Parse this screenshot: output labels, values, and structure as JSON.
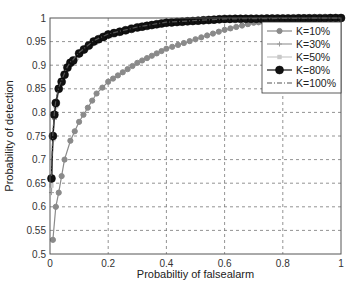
{
  "chart_data": {
    "type": "line",
    "title": "",
    "xlabel": "Probabiltiy of falsealarm",
    "ylabel": "Probability of detection",
    "xlim": [
      0,
      1
    ],
    "ylim": [
      0.5,
      1
    ],
    "xticks": [
      "0",
      "0.2",
      "0.4",
      "0.6",
      "0.8",
      "1"
    ],
    "yticks": [
      "0.5",
      "0.55",
      "0.6",
      "0.65",
      "0.7",
      "0.75",
      "0.8",
      "0.85",
      "0.9",
      "0.95",
      "1"
    ],
    "grid": true,
    "legend_position": "upper right",
    "series": [
      {
        "name": "K=10%",
        "color": "#8a8a8a",
        "marker": "circle-small",
        "line": "solid",
        "x": [
          0.01,
          0.02,
          0.03,
          0.04,
          0.05,
          0.07,
          0.1,
          0.13,
          0.16,
          0.2,
          0.25,
          0.3,
          0.35,
          0.4,
          0.5,
          0.6,
          0.7,
          0.8,
          1.0
        ],
        "y": [
          0.53,
          0.6,
          0.63,
          0.665,
          0.7,
          0.74,
          0.78,
          0.81,
          0.84,
          0.865,
          0.885,
          0.905,
          0.92,
          0.935,
          0.955,
          0.975,
          0.99,
          0.995,
          1.0
        ]
      },
      {
        "name": "K=30%",
        "color": "#9a9a9a",
        "marker": "plus",
        "line": "solid",
        "x": [
          0.005,
          0.01,
          0.015,
          0.02,
          0.03,
          0.04,
          0.05,
          0.06,
          0.07,
          0.08,
          0.1,
          0.15,
          0.2,
          0.3,
          0.4,
          0.6,
          1.0
        ],
        "y": [
          0.63,
          0.74,
          0.785,
          0.81,
          0.845,
          0.86,
          0.875,
          0.89,
          0.9,
          0.905,
          0.92,
          0.945,
          0.96,
          0.978,
          0.988,
          0.997,
          1.0
        ]
      },
      {
        "name": "K=50%",
        "color": "#c8c8c8",
        "marker": "square",
        "line": "solid",
        "x": [
          0.005,
          0.01,
          0.015,
          0.02,
          0.03,
          0.04,
          0.05,
          0.06,
          0.07,
          0.08,
          0.1,
          0.15,
          0.2,
          0.3,
          0.4,
          0.6,
          1.0
        ],
        "y": [
          0.645,
          0.745,
          0.79,
          0.815,
          0.848,
          0.862,
          0.878,
          0.892,
          0.902,
          0.908,
          0.922,
          0.948,
          0.962,
          0.979,
          0.989,
          0.998,
          1.0
        ]
      },
      {
        "name": "K=80%",
        "color": "#111111",
        "marker": "circle-large",
        "line": "solid",
        "x": [
          0.005,
          0.01,
          0.015,
          0.02,
          0.03,
          0.04,
          0.05,
          0.06,
          0.07,
          0.08,
          0.1,
          0.15,
          0.2,
          0.3,
          0.4,
          0.6,
          1.0
        ],
        "y": [
          0.66,
          0.75,
          0.795,
          0.82,
          0.85,
          0.865,
          0.88,
          0.895,
          0.905,
          0.91,
          0.925,
          0.95,
          0.965,
          0.98,
          0.99,
          0.998,
          1.0
        ]
      },
      {
        "name": "K=100%",
        "color": "#555555",
        "marker": "none",
        "line": "dashdot",
        "x": [
          0.005,
          0.01,
          0.015,
          0.02,
          0.03,
          0.04,
          0.05,
          0.06,
          0.07,
          0.08,
          0.1,
          0.15,
          0.2,
          0.3,
          0.4,
          0.6,
          1.0
        ],
        "y": [
          0.665,
          0.755,
          0.8,
          0.825,
          0.853,
          0.868,
          0.883,
          0.897,
          0.907,
          0.912,
          0.927,
          0.952,
          0.966,
          0.981,
          0.991,
          0.998,
          1.0
        ]
      }
    ]
  }
}
